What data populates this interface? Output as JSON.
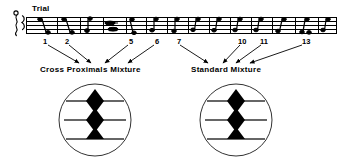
{
  "figure": {
    "title_label": "Trial",
    "staff": {
      "icon": "brace-clef-icon",
      "line_count": 5,
      "measure_count": 13,
      "note_glyph": "eighth-note-icon"
    },
    "trial_numbers": [
      {
        "n": "1",
        "x": 46
      },
      {
        "n": "2",
        "x": 67
      },
      {
        "n": "5",
        "x": 131
      },
      {
        "n": "6",
        "x": 157
      },
      {
        "n": "7",
        "x": 178
      },
      {
        "n": "10",
        "x": 241
      },
      {
        "n": "11",
        "x": 262
      },
      {
        "n": "13",
        "x": 305
      }
    ],
    "insets": [
      {
        "id": "cross-proximals-mixture",
        "caption": "Cross Proximals Mixture",
        "cx": 95,
        "cy": 120,
        "r": 36,
        "stimulus": "three-horizontal-lines-with-triangles",
        "line_count": 3,
        "triangle_count": 4
      },
      {
        "id": "standard-mixture",
        "caption": "Standard Mixture",
        "cx": 236,
        "cy": 120,
        "r": 36,
        "stimulus": "three-horizontal-lines-with-triangles",
        "line_count": 3,
        "triangle_count": 4
      }
    ],
    "arrows": [
      {
        "from_x": 46,
        "from_y": 46,
        "to_x": 78,
        "to_y": 64
      },
      {
        "from_x": 67,
        "from_y": 46,
        "to_x": 90,
        "to_y": 64
      },
      {
        "from_x": 131,
        "from_y": 46,
        "to_x": 104,
        "to_y": 64
      },
      {
        "from_x": 157,
        "from_y": 46,
        "to_x": 127,
        "to_y": 64
      },
      {
        "from_x": 178,
        "from_y": 46,
        "to_x": 207,
        "to_y": 64
      },
      {
        "from_x": 241,
        "from_y": 46,
        "to_x": 222,
        "to_y": 64
      },
      {
        "from_x": 262,
        "from_y": 46,
        "to_x": 234,
        "to_y": 64
      },
      {
        "from_x": 305,
        "from_y": 46,
        "to_x": 247,
        "to_y": 64
      }
    ],
    "colors": {
      "ink": "#000000",
      "background": "#ffffff",
      "line": "#333333"
    }
  }
}
